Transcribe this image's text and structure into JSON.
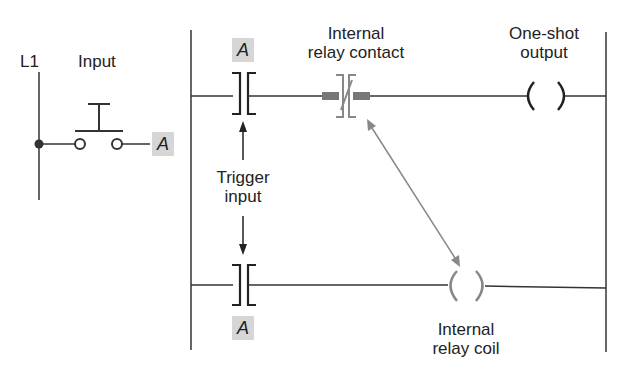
{
  "diagram": {
    "type": "ladder-logic one-shot circuit",
    "labels": {
      "rail": "L1",
      "input": "Input",
      "input_tag": "A",
      "top_contact_tag": "A",
      "bottom_contact_tag": "A",
      "internal_contact_line1": "Internal",
      "internal_contact_line2": "relay contact",
      "output_line1": "One-shot",
      "output_line2": "output",
      "trigger_line1": "Trigger",
      "trigger_line2": "input",
      "coil_line1": "Internal",
      "coil_line2": "relay coil"
    },
    "colors": {
      "line": "#333333",
      "internal_gray": "#888888",
      "tag_bg": "#d6d6d6"
    }
  }
}
